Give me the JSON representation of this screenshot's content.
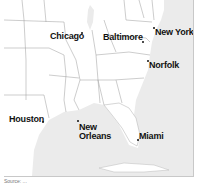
{
  "map": {
    "region": "Eastern United States",
    "water_color": "#ebebeb",
    "land_color": "#ffffff",
    "border_color": "#9a9a9a",
    "cities": [
      {
        "name": "Chicago",
        "label_x": 50,
        "label_y": 33,
        "dot_x": 81,
        "dot_y": 32
      },
      {
        "name": "Baltimore",
        "label_x": 105,
        "label_y": 33,
        "dot_x": 142,
        "dot_y": 41
      },
      {
        "name": "New York",
        "label_x": 155,
        "label_y": 28,
        "dot_x": 153,
        "dot_y": 27
      },
      {
        "name": "Norfolk",
        "label_x": 149,
        "label_y": 61,
        "dot_x": 147,
        "dot_y": 60
      },
      {
        "name": "Houston",
        "label_x": 9,
        "label_y": 115,
        "dot_x": 42,
        "dot_y": 121
      },
      {
        "name": "New",
        "label_x": 78,
        "label_y": 123,
        "dot_x": 77,
        "dot_y": 120
      },
      {
        "name": "Orleans",
        "label_x": 78,
        "label_y": 132,
        "dot_x": null,
        "dot_y": null
      },
      {
        "name": "Miami",
        "label_x": 139,
        "label_y": 134,
        "dot_x": 137,
        "dot_y": 139
      }
    ]
  },
  "caption": "Source: ..."
}
